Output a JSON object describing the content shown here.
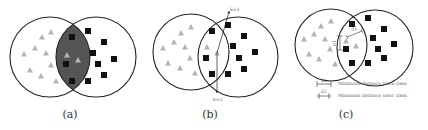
{
  "figure": {
    "panels": [
      {
        "id": "a",
        "caption": "(a)",
        "description": "Two overlapping class regions; overlap region shaded dark gray",
        "overlap_shaded": true
      },
      {
        "id": "b",
        "caption": "(b)",
        "description": "Two overlapping class regions with k-neighbour arrows",
        "labels": {
          "top_arrow": "k=3",
          "bottom_arrow": "k=2"
        }
      },
      {
        "id": "c",
        "caption": "(c)",
        "description": "Two overlapping class regions with distance annotations",
        "annotations": {
          "d1": "d1",
          "d2": "d2"
        },
        "legend": [
          {
            "symbol": "d1",
            "text": "Minimum distance intra class"
          },
          {
            "symbol": "d2",
            "text": "Minimum distance inter class"
          }
        ]
      }
    ],
    "classes": [
      {
        "name": "triangle-class",
        "marker": "triangle",
        "color": "#b0b0b0"
      },
      {
        "name": "square-class",
        "marker": "square",
        "color": "#111111"
      }
    ],
    "colors": {
      "circle_stroke": "#222222",
      "overlap_fill": "#555555",
      "background": "#ffffff"
    }
  }
}
